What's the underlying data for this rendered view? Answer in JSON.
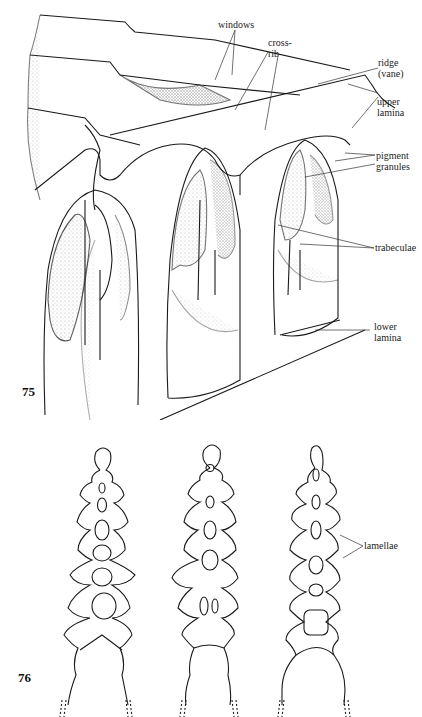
{
  "figures": [
    {
      "number": "75",
      "labels": {
        "windows": "windows",
        "cross_rib": "cross-\nrib",
        "ridge": "ridge\n(vane)",
        "upper_lamina": "upper\nlamina",
        "pigment_granules": "pigment\ngranules",
        "trabeculae": "trabeculae",
        "lower_lamina": "lower\nlamina"
      }
    },
    {
      "number": "76",
      "labels": {
        "lamellae": "lamellae"
      }
    }
  ],
  "colors": {
    "ink": "#1a1a1a",
    "stipple": "#7a7a7a",
    "paper": "#ffffff"
  }
}
